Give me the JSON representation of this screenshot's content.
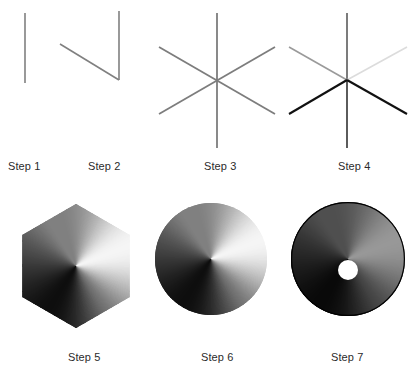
{
  "page": {
    "background_color": "#ffffff",
    "width": 414,
    "height": 367
  },
  "palette": {
    "line_gray": "#808080",
    "line_light": "#c9c9c9",
    "line_lighter": "#dcdcdc",
    "line_dark": "#1a1a1a",
    "line_mid_dark": "#4a4a4a",
    "caption_color": "#2b2b2b",
    "hole_fill": "#ffffff",
    "gradient_light": "#f2f2f2",
    "gradient_dark": "#050505"
  },
  "steps": [
    {
      "id": "step-1",
      "label": "Step 1",
      "caption_x": 8,
      "caption_y": 160,
      "figure": {
        "kind": "lines",
        "x": 0,
        "y": 8,
        "w": 80,
        "h": 135,
        "lines": [
          {
            "name": "vertical-line",
            "x1": 25,
            "y1": 5,
            "x2": 25,
            "y2": 75,
            "stroke": "#808080",
            "width": 1.6
          }
        ]
      }
    },
    {
      "id": "step-2",
      "label": "Step 2",
      "caption_x": 88,
      "caption_y": 160,
      "figure": {
        "kind": "lines",
        "x": 55,
        "y": 8,
        "w": 90,
        "h": 135,
        "lines": [
          {
            "name": "vertical-line",
            "x1": 64,
            "y1": 3,
            "x2": 64,
            "y2": 72,
            "stroke": "#808080",
            "width": 1.6
          },
          {
            "name": "upper-left-diagonal",
            "x1": 5,
            "y1": 36,
            "x2": 64,
            "y2": 72,
            "stroke": "#808080",
            "width": 1.6
          }
        ]
      }
    },
    {
      "id": "step-3",
      "label": "Step 3",
      "caption_x": 204,
      "caption_y": 160,
      "figure": {
        "kind": "lines",
        "x": 155,
        "y": 8,
        "w": 130,
        "h": 145,
        "lines": [
          {
            "name": "vertical-spoke",
            "x1": 62,
            "y1": 5,
            "x2": 62,
            "y2": 140,
            "stroke": "#7d7d7d",
            "width": 1.8
          },
          {
            "name": "upper-left-to-lower-right-spoke",
            "x1": 4,
            "y1": 39,
            "x2": 120,
            "y2": 106,
            "stroke": "#7d7d7d",
            "width": 1.8
          },
          {
            "name": "lower-left-to-upper-right-spoke",
            "x1": 4,
            "y1": 106,
            "x2": 120,
            "y2": 39,
            "stroke": "#7d7d7d",
            "width": 1.8
          }
        ]
      }
    },
    {
      "id": "step-4",
      "label": "Step 4",
      "caption_x": 338,
      "caption_y": 160,
      "figure": {
        "kind": "lines-shaded",
        "x": 285,
        "y": 8,
        "w": 129,
        "h": 145,
        "lines": [
          {
            "name": "vertical-spoke-top",
            "x1": 62,
            "y1": 5,
            "x2": 62,
            "y2": 72,
            "stroke": "#6e6e6e",
            "width": 1.8
          },
          {
            "name": "vertical-spoke-bottom",
            "x1": 62,
            "y1": 72,
            "x2": 62,
            "y2": 140,
            "stroke": "#4a4a4a",
            "width": 1.8
          },
          {
            "name": "upper-left-spoke-light",
            "x1": 4,
            "y1": 39,
            "x2": 62,
            "y2": 72,
            "stroke": "#9a9a9a",
            "width": 1.6
          },
          {
            "name": "upper-right-spoke-lightest",
            "x1": 62,
            "y1": 72,
            "x2": 122,
            "y2": 39,
            "stroke": "#dcdcdc",
            "width": 1.6
          },
          {
            "name": "lower-left-spoke-dark",
            "x1": 4,
            "y1": 106,
            "x2": 62,
            "y2": 72,
            "stroke": "#111111",
            "width": 2.1
          },
          {
            "name": "lower-right-spoke-dark",
            "x1": 62,
            "y1": 72,
            "x2": 122,
            "y2": 106,
            "stroke": "#111111",
            "width": 2.1
          }
        ]
      }
    },
    {
      "id": "step-5",
      "label": "Step 5",
      "caption_x": 68,
      "caption_y": 351,
      "figure": {
        "kind": "hexagon-gradient",
        "x": 14,
        "y": 197,
        "w": 124,
        "h": 138,
        "center_x": 62,
        "center_y": 69,
        "radius": 62,
        "orientation": "pointy-top",
        "gradient": "conic-metal"
      }
    },
    {
      "id": "step-6",
      "label": "Step 6",
      "caption_x": 201,
      "caption_y": 351,
      "figure": {
        "kind": "circle-gradient",
        "x": 155,
        "y": 201,
        "w": 112,
        "h": 116,
        "center_x": 56,
        "center_y": 58,
        "radius": 56,
        "gradient": "conic-metal"
      }
    },
    {
      "id": "step-7",
      "label": "Step 7",
      "caption_x": 331,
      "caption_y": 351,
      "figure": {
        "kind": "disc-gradient-with-hole",
        "x": 291,
        "y": 201,
        "w": 114,
        "h": 116,
        "center_x": 57,
        "center_y": 58,
        "radius": 57,
        "hole_center_x": 57,
        "hole_center_y": 69,
        "hole_radius": 10,
        "gradient": "conic-metal-dark",
        "has_outline": true
      }
    }
  ]
}
